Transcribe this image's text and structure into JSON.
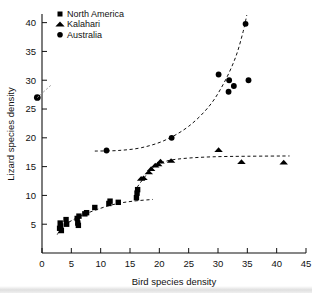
{
  "chart_data": {
    "type": "scatter",
    "title": "",
    "xlabel": "Bird species density",
    "ylabel": "Lizard species density",
    "xlim": [
      0,
      45
    ],
    "ylim": [
      0,
      41.5
    ],
    "xticks": [
      0,
      5,
      10,
      15,
      20,
      25,
      30,
      35,
      40,
      45
    ],
    "yticks": [
      5,
      10,
      15,
      20,
      25,
      30,
      35,
      40
    ],
    "xtick_labels": [
      "0",
      "5",
      "10",
      "15",
      "20",
      "25",
      "30",
      "35",
      "40",
      "45"
    ],
    "ytick_labels": [
      "5",
      "10",
      "15",
      "20",
      "25",
      "30",
      "35",
      "40"
    ],
    "grid": false,
    "legend_position": "top-left",
    "marker_color": "#000000",
    "axis_color": "#111111",
    "series": [
      {
        "name": "North America",
        "marker": "square",
        "points": [
          [
            3.0,
            4.3
          ],
          [
            3.1,
            5.2
          ],
          [
            3.2,
            4.7
          ],
          [
            3.3,
            3.9
          ],
          [
            4.1,
            5.8
          ],
          [
            4.2,
            5.0
          ],
          [
            6.0,
            6.0
          ],
          [
            6.1,
            5.2
          ],
          [
            6.2,
            4.8
          ],
          [
            6.3,
            6.4
          ],
          [
            7.3,
            6.8
          ],
          [
            7.6,
            7.0
          ],
          [
            9.0,
            7.9
          ],
          [
            11.4,
            8.6
          ],
          [
            11.6,
            9.0
          ],
          [
            13.0,
            8.8
          ],
          [
            16.1,
            9.6
          ],
          [
            16.2,
            10.4
          ],
          [
            16.3,
            11.0
          ]
        ],
        "fit": [
          [
            2.6,
            3.2
          ],
          [
            3.5,
            4.6
          ],
          [
            5.0,
            5.6
          ],
          [
            7.0,
            6.6
          ],
          [
            9.5,
            7.6
          ],
          [
            12.5,
            8.5
          ],
          [
            15.5,
            9.0
          ],
          [
            18.9,
            9.3
          ]
        ]
      },
      {
        "name": "Kalahari",
        "marker": "triangle",
        "points": [
          [
            16.9,
            12.9
          ],
          [
            17.3,
            13.0
          ],
          [
            18.2,
            14.0
          ],
          [
            18.6,
            14.6
          ],
          [
            19.3,
            15.2
          ],
          [
            19.8,
            15.4
          ],
          [
            20.2,
            15.9
          ],
          [
            22.0,
            16.0
          ],
          [
            30.1,
            17.9
          ],
          [
            34.0,
            15.8
          ],
          [
            41.2,
            15.7
          ]
        ],
        "fit": [
          [
            16.2,
            11.4
          ],
          [
            17.5,
            13.2
          ],
          [
            19.0,
            14.9
          ],
          [
            21.0,
            15.9
          ],
          [
            24.0,
            16.4
          ],
          [
            29.0,
            16.7
          ],
          [
            35.0,
            16.8
          ],
          [
            42.2,
            16.85
          ]
        ]
      },
      {
        "name": "Australia",
        "marker": "circle",
        "points": [
          [
            11.0,
            17.8
          ],
          [
            22.1,
            20.0
          ],
          [
            30.1,
            31.0
          ],
          [
            31.9,
            30.0
          ],
          [
            31.8,
            28.0
          ],
          [
            32.7,
            29.0
          ],
          [
            35.2,
            30.0
          ],
          [
            34.7,
            39.8
          ]
        ],
        "fit": [
          [
            9.0,
            17.7
          ],
          [
            13.0,
            17.8
          ],
          [
            17.0,
            18.3
          ],
          [
            21.0,
            19.6
          ],
          [
            25.0,
            22.0
          ],
          [
            28.5,
            25.5
          ],
          [
            31.0,
            29.5
          ],
          [
            33.0,
            34.0
          ],
          [
            34.3,
            38.5
          ],
          [
            34.9,
            41.3
          ]
        ]
      }
    ],
    "annotations": [
      {
        "name": "off-axis-marker",
        "marker": "circle",
        "x": -0.8,
        "y": 27.0,
        "note": ""
      },
      {
        "name": "off-axis-tail",
        "marker": "line",
        "x1": -0.8,
        "y1": 27.0,
        "x2": 1.6,
        "y2": 29.2
      }
    ]
  },
  "legend": {
    "entries": [
      {
        "label": "North America",
        "marker": "square"
      },
      {
        "label": "Kalahari",
        "marker": "triangle"
      },
      {
        "label": "Australia",
        "marker": "circle"
      }
    ]
  },
  "axes": {
    "x_title": "Bird species density",
    "y_title": "Lizard species density"
  }
}
